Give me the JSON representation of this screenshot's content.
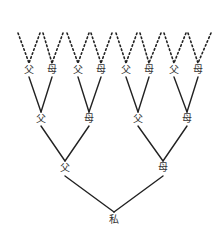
{
  "diagram": {
    "type": "family-tree",
    "line_color": "#222222",
    "nodes": {
      "self": {
        "label": "私",
        "x": 114,
        "y": 220
      },
      "gen1": [
        {
          "label": "父",
          "x": 65,
          "y": 168
        },
        {
          "label": "母",
          "x": 163,
          "y": 168
        }
      ],
      "gen2": [
        {
          "label": "父",
          "x": 41,
          "y": 119
        },
        {
          "label": "母",
          "x": 89,
          "y": 119
        },
        {
          "label": "父",
          "x": 138,
          "y": 119
        },
        {
          "label": "母",
          "x": 187,
          "y": 119
        }
      ],
      "gen3": [
        {
          "label": "父",
          "x": 29,
          "y": 70
        },
        {
          "label": "母",
          "x": 52,
          "y": 70
        },
        {
          "label": "父",
          "x": 78,
          "y": 70
        },
        {
          "label": "母",
          "x": 101,
          "y": 70
        },
        {
          "label": "父",
          "x": 126,
          "y": 70
        },
        {
          "label": "母",
          "x": 149,
          "y": 70
        },
        {
          "label": "父",
          "x": 174,
          "y": 70
        },
        {
          "label": "母",
          "x": 198,
          "y": 70
        }
      ]
    }
  }
}
